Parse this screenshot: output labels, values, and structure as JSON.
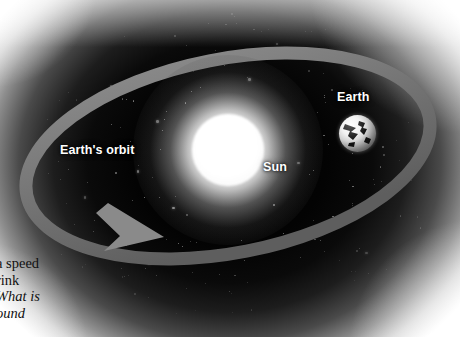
{
  "figure": {
    "type": "astronomy-diagram",
    "background_color": "#000000",
    "orbit_band_color": "#787878",
    "sun_color": "#ffffff",
    "label_color": "#ffffff"
  },
  "labels": {
    "earths_orbit": "Earth's orbit",
    "sun": "Sun",
    "earth": "Earth"
  },
  "objects": {
    "sun": {
      "name": "Sun",
      "center_x": 228,
      "center_y": 150,
      "radius": 36
    },
    "earth": {
      "name": "Earth",
      "center_x": 357,
      "center_y": 133,
      "radius": 18
    },
    "orbit": {
      "name": "Earth's orbit",
      "shape": "ellipse",
      "center_x": 228,
      "center_y": 156,
      "radius_x": 205,
      "radius_y": 98,
      "rotation_deg": -11,
      "band_width": 13,
      "direction": "counterclockwise",
      "arrow_tip_x": 158,
      "arrow_tip_y": 237
    }
  },
  "caption": {
    "line1": "a speed",
    "line2": "rink",
    "line3": "What is",
    "line4": "ound"
  },
  "ghost_text": {
    "note": "faint page bleed-through, illegible",
    "line1": " ",
    "line2": " "
  }
}
